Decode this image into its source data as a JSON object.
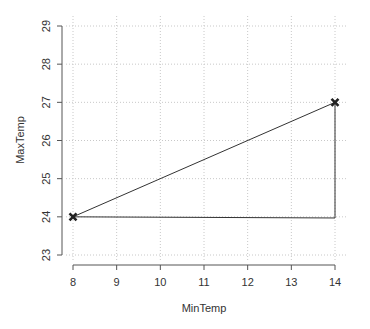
{
  "chart_data": {
    "type": "line",
    "title": "",
    "xlabel": "MinTemp",
    "ylabel": "MaxTemp",
    "xlim": [
      8,
      14
    ],
    "ylim": [
      23,
      29
    ],
    "x_ticks": [
      8,
      9,
      10,
      11,
      12,
      13,
      14
    ],
    "y_ticks": [
      23,
      24,
      25,
      26,
      27,
      28,
      29
    ],
    "grid": true,
    "series": [
      {
        "name": "path",
        "points": [
          [
            8,
            24
          ],
          [
            14,
            27
          ],
          [
            14,
            23.97
          ],
          [
            8,
            24
          ]
        ],
        "color": "#333333"
      }
    ],
    "markers": [
      {
        "x": 8,
        "y": 24,
        "shape": "x"
      },
      {
        "x": 14,
        "y": 27,
        "shape": "x"
      }
    ]
  }
}
